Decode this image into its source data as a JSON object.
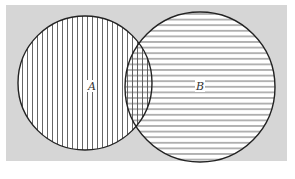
{
  "diagram": {
    "type": "venn",
    "background_color": "#d6d6d6",
    "outline_color": "#222222",
    "hatch_color": "#555555",
    "fill_color": "#ffffff",
    "sets": [
      {
        "id": "A",
        "label": "A",
        "hatch": "vertical"
      },
      {
        "id": "B",
        "label": "B",
        "hatch": "horizontal"
      }
    ],
    "intersection": {
      "hatch": "crosshatch"
    }
  }
}
